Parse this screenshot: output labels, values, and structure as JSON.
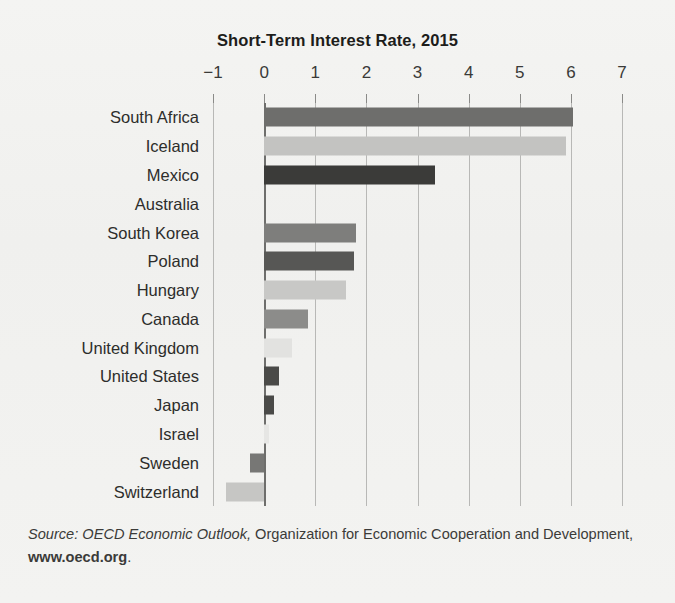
{
  "chart_data": {
    "type": "bar",
    "orientation": "horizontal",
    "title": "Short-Term Interest Rate, 2015",
    "xlabel": "",
    "ylabel": "",
    "xlim": [
      -1,
      7
    ],
    "xticks": [
      -1,
      0,
      1,
      2,
      3,
      4,
      5,
      6,
      7
    ],
    "xtick_labels": [
      "−1",
      "0",
      "1",
      "2",
      "3",
      "4",
      "5",
      "6",
      "7"
    ],
    "grid": true,
    "legend": false,
    "categories": [
      "South Africa",
      "Iceland",
      "Mexico",
      "Australia",
      "South Korea",
      "Poland",
      "Hungary",
      "Canada",
      "United Kingdom",
      "United States",
      "Japan",
      "Israel",
      "Sweden",
      "Switzerland"
    ],
    "values": [
      6.05,
      5.9,
      3.35,
      0.0,
      1.8,
      1.75,
      1.6,
      0.85,
      0.55,
      0.3,
      0.2,
      0.1,
      -0.27,
      -0.75
    ],
    "bar_colors": [
      "#6e6e6c",
      "#c3c3c1",
      "#3b3b39",
      "#ffffff",
      "#7e7e7c",
      "#575755",
      "#c8c8c6",
      "#8c8c8a",
      "#e2e2e0",
      "#4a4a48",
      "#4a4a48",
      "#e6e6e4",
      "#77777 5",
      "#c6c6c4"
    ]
  },
  "source": {
    "label": "Source: OECD Economic Outlook,",
    "body": " Organization for Economic Cooperation and Development, ",
    "url": "www.oecd.org",
    "end": "."
  },
  "colors": {
    "background": "#f2f2f0",
    "text": "#231f20",
    "gridline": "#b8b8b6",
    "axis": "#6e6e6c"
  }
}
